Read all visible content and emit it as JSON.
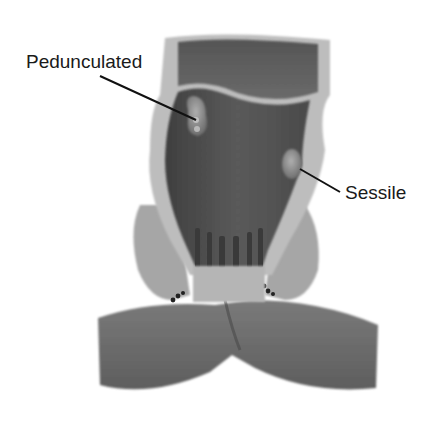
{
  "figure": {
    "background": "#ffffff",
    "colors": {
      "lumen_dark": "#4a4a4a",
      "lumen_mid": "#6e6e6e",
      "wall_light": "#b8b8b8",
      "wall_highlight": "#d6d6d6",
      "muscle": "#9a9a9a",
      "buttock": "#6a6a6a",
      "label_text": "#1a1a1a",
      "leader_line": "#111111"
    }
  },
  "labels": [
    {
      "id": "pedunculated",
      "text": "Pedunculated",
      "anchor": [
        196,
        120
      ],
      "text_pos": [
        26,
        52
      ]
    },
    {
      "id": "sessile",
      "text": "Sessile",
      "anchor": [
        300,
        169
      ],
      "text_pos": [
        345,
        183
      ]
    }
  ]
}
